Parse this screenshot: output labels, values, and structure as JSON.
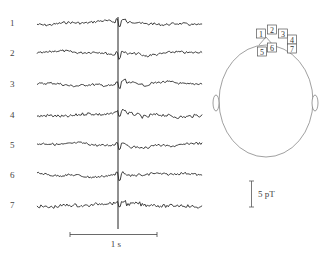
{
  "figure": {
    "channels": [
      {
        "label": "1",
        "y": 23
      },
      {
        "label": "2",
        "y": 53
      },
      {
        "label": "3",
        "y": 84
      },
      {
        "label": "4",
        "y": 115
      },
      {
        "label": "5",
        "y": 145
      },
      {
        "label": "6",
        "y": 175
      },
      {
        "label": "7",
        "y": 205
      }
    ],
    "time_scale": {
      "label": "1 s"
    },
    "amplitude_scale": {
      "label": "5 pT"
    },
    "head_map": {
      "sensors": [
        {
          "label": "1",
          "x": 261,
          "y": 34
        },
        {
          "label": "2",
          "x": 272,
          "y": 30
        },
        {
          "label": "3",
          "x": 283,
          "y": 34
        },
        {
          "label": "4",
          "x": 292,
          "y": 40
        },
        {
          "label": "5",
          "x": 262,
          "y": 52
        },
        {
          "label": "6",
          "x": 272,
          "y": 48
        },
        {
          "label": "7",
          "x": 292,
          "y": 49
        }
      ]
    }
  }
}
